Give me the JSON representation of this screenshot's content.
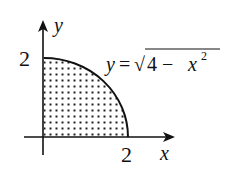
{
  "figure": {
    "type": "region-under-curve",
    "axes": {
      "x_label": "x",
      "y_label": "y",
      "x_tick": "2",
      "y_tick": "2"
    },
    "curve": {
      "label_lhs": "y",
      "label_eq": "=",
      "label_sqrt": "√",
      "label_radicand": "4 − x",
      "label_exp": "2",
      "equation": "y = √(4 − x²)"
    },
    "region": {
      "fill_pattern": "dots",
      "x_range": [
        0,
        2
      ],
      "y_range": [
        0,
        2
      ]
    },
    "colors": {
      "ink": "#111111",
      "background": "#ffffff"
    }
  }
}
